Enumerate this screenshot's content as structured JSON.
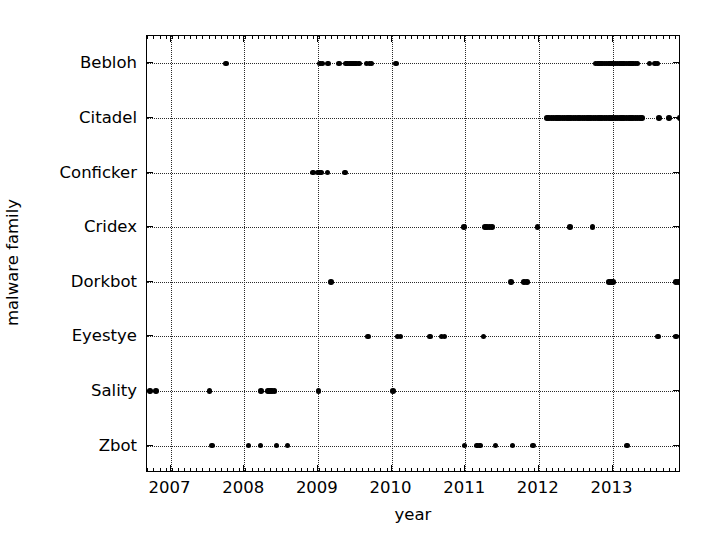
{
  "chart_data": {
    "type": "scatter",
    "title": "",
    "xlabel": "year",
    "ylabel": "malware family",
    "xlim": [
      2006.68,
      2013.93
    ],
    "xticks": [
      2007,
      2008,
      2009,
      2010,
      2011,
      2012,
      2013
    ],
    "xticklabels": [
      "2007",
      "2008",
      "2009",
      "2010",
      "2011",
      "2012",
      "2013"
    ],
    "x_minor_tick_interval": 0.0833,
    "categories": [
      "Bebloh",
      "Citadel",
      "Conficker",
      "Cridex",
      "Dorkbot",
      "Eyestye",
      "Sality",
      "Zbot"
    ],
    "grid": true,
    "grid_style": "dotted",
    "legend": "none",
    "marker": "circle",
    "marker_color": "#000000",
    "series": [
      {
        "name": "Bebloh",
        "y": 7,
        "x": [
          2007.75,
          2009.03,
          2009.06,
          2009.14,
          2009.29,
          2009.38,
          2009.4,
          2009.43,
          2009.45,
          2009.47,
          2009.49,
          2009.52,
          2009.56,
          2009.66,
          2009.7,
          2009.73,
          2010.06,
          2012.77,
          2012.8,
          2012.83,
          2012.86,
          2012.89,
          2012.92,
          2012.95,
          2012.98,
          2013.01,
          2013.04,
          2013.07,
          2013.1,
          2013.13,
          2013.16,
          2013.19,
          2013.22,
          2013.25,
          2013.28,
          2013.31,
          2013.34,
          2013.5,
          2013.58,
          2013.61
        ]
      },
      {
        "name": "Citadel",
        "y": 6,
        "x": [
          2012.11,
          2012.14,
          2012.17,
          2012.2,
          2012.23,
          2012.26,
          2012.29,
          2012.32,
          2012.35,
          2012.38,
          2012.41,
          2012.44,
          2012.47,
          2012.5,
          2012.53,
          2012.56,
          2012.59,
          2012.62,
          2012.65,
          2012.68,
          2012.71,
          2012.74,
          2012.77,
          2012.8,
          2012.83,
          2012.86,
          2012.89,
          2012.92,
          2012.95,
          2012.98,
          2013.01,
          2013.04,
          2013.07,
          2013.1,
          2013.13,
          2013.16,
          2013.19,
          2013.22,
          2013.25,
          2013.28,
          2013.31,
          2013.34,
          2013.37,
          2013.4,
          2013.63,
          2013.77,
          2013.92
        ]
      },
      {
        "name": "Conficker",
        "y": 5,
        "x": [
          2008.93,
          2009.0,
          2009.02,
          2009.04,
          2009.13,
          2009.37
        ]
      },
      {
        "name": "Cridex",
        "y": 4,
        "x": [
          2010.98,
          2011.27,
          2011.3,
          2011.33,
          2011.36,
          2011.98,
          2012.42,
          2012.73
        ]
      },
      {
        "name": "Dorkbot",
        "y": 3,
        "x": [
          2009.18,
          2011.62,
          2011.8,
          2011.84,
          2012.95,
          2012.98,
          2013.01,
          2013.86,
          2013.9
        ]
      },
      {
        "name": "Eyestye",
        "y": 2,
        "x": [
          2009.68,
          2010.08,
          2010.12,
          2010.52,
          2010.68,
          2010.72,
          2011.25,
          2013.62,
          2013.86
        ]
      },
      {
        "name": "Sality",
        "y": 1,
        "x": [
          2006.72,
          2006.8,
          2007.53,
          2008.23,
          2008.32,
          2008.35,
          2008.38,
          2008.41,
          2009.01,
          2010.02
        ]
      },
      {
        "name": "Zbot",
        "y": 0,
        "x": [
          2007.56,
          2008.06,
          2008.22,
          2008.44,
          2008.59,
          2010.99,
          2011.16,
          2011.2,
          2011.41,
          2011.64,
          2011.92,
          2013.2
        ]
      }
    ]
  },
  "axes": {
    "x_axis_label": "year",
    "y_axis_label": "malware family"
  }
}
